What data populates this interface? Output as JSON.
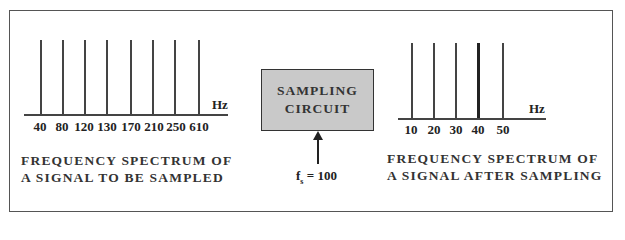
{
  "diagram": {
    "input_spectrum": {
      "unit_label": "Hz",
      "frequencies": [
        "40",
        "80",
        "120",
        "130",
        "170",
        "210",
        "250",
        "610"
      ],
      "caption_line1": "FREQUENCY SPECTRUM OF",
      "caption_line2": "A SIGNAL TO BE SAMPLED"
    },
    "sampler": {
      "label_line1": "SAMPLING",
      "label_line2": "CIRCUIT",
      "sampling_rate_symbol": "f",
      "sampling_rate_subscript": "s",
      "sampling_rate_value": "= 100",
      "fill_color": "#c9c9c9"
    },
    "output_spectrum": {
      "unit_label": "Hz",
      "frequencies": [
        "10",
        "20",
        "30",
        "40",
        "50"
      ],
      "emphasized_frequency": "40",
      "caption_line1": "FREQUENCY SPECTRUM OF",
      "caption_line2": "A SIGNAL AFTER SAMPLING"
    }
  }
}
